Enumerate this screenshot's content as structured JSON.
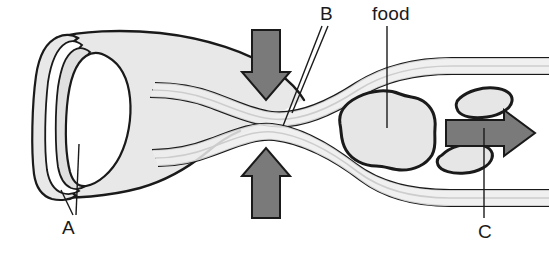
{
  "diagram": {
    "labels": [
      {
        "id": "A",
        "text": "A",
        "points_to": "tract-wall-layers-cross-section"
      },
      {
        "id": "B",
        "text": "B",
        "points_to": "constricted-wall-layers"
      },
      {
        "id": "food",
        "text": "food",
        "points_to": "food-bolus"
      },
      {
        "id": "C",
        "text": "C",
        "points_to": "direction-of-movement-arrow"
      }
    ],
    "colors": {
      "background": "#ffffff",
      "outline": "#1a1a1a",
      "organ_fill": "#e8e8e8",
      "lumen_fill": "#ffffff",
      "arrow_fill": "#7a7a7a",
      "arrow_outline": "#1a1a1a",
      "food_fill": "#e6e6e6",
      "label_color": "#1a1a1a"
    },
    "arrows": [
      {
        "name": "compression-arrow-down",
        "direction": "down"
      },
      {
        "name": "compression-arrow-up",
        "direction": "up"
      },
      {
        "name": "movement-arrow-right",
        "direction": "right"
      }
    ],
    "food_items": [
      {
        "name": "food-bolus-main"
      },
      {
        "name": "food-fragment-upper"
      },
      {
        "name": "food-fragment-lower"
      }
    ]
  }
}
